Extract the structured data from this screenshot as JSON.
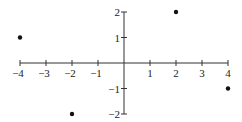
{
  "chart_data": {
    "type": "scatter",
    "title": "",
    "xlabel": "",
    "ylabel": "",
    "xlim": [
      -4,
      4
    ],
    "ylim": [
      -2,
      2
    ],
    "grid": false,
    "x_ticks": [
      -4,
      -3,
      -2,
      -1,
      1,
      2,
      3,
      4
    ],
    "x_tick_labels": [
      "−4",
      "−3",
      "−2",
      "−1",
      "1",
      "2",
      "3",
      "4"
    ],
    "y_ticks": [
      2,
      1,
      -1,
      -2
    ],
    "y_tick_labels": [
      "2",
      "1",
      "−1",
      "−2"
    ],
    "points": [
      {
        "x": -4,
        "y": 1
      },
      {
        "x": 2,
        "y": 2
      },
      {
        "x": 4,
        "y": -1
      },
      {
        "x": -2,
        "y": -2
      }
    ],
    "colors": {
      "axis": "#333333",
      "point": "#111111"
    }
  }
}
